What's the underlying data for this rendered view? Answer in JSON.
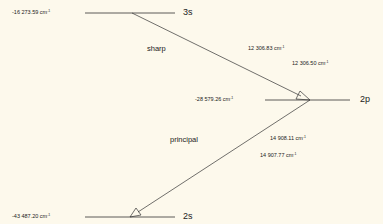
{
  "unit": "cm",
  "unit_exp": "-1",
  "levels": [
    {
      "term": "3s",
      "energy": "-16 273.59"
    },
    {
      "term": "2p",
      "energy": "-28 579.26"
    },
    {
      "term": "2s",
      "energy": "-43 487.20"
    }
  ],
  "transitions": [
    {
      "series": "sharp",
      "from": "3s",
      "to": "2p",
      "wavenumbers": [
        "12 306.83",
        "12 306.50"
      ]
    },
    {
      "series": "principal",
      "from": "2p",
      "to": "2s",
      "wavenumbers": [
        "14 908.11",
        "14 907.77"
      ]
    }
  ],
  "colors": {
    "background": "#fdf9ec",
    "ink": "#222222"
  }
}
